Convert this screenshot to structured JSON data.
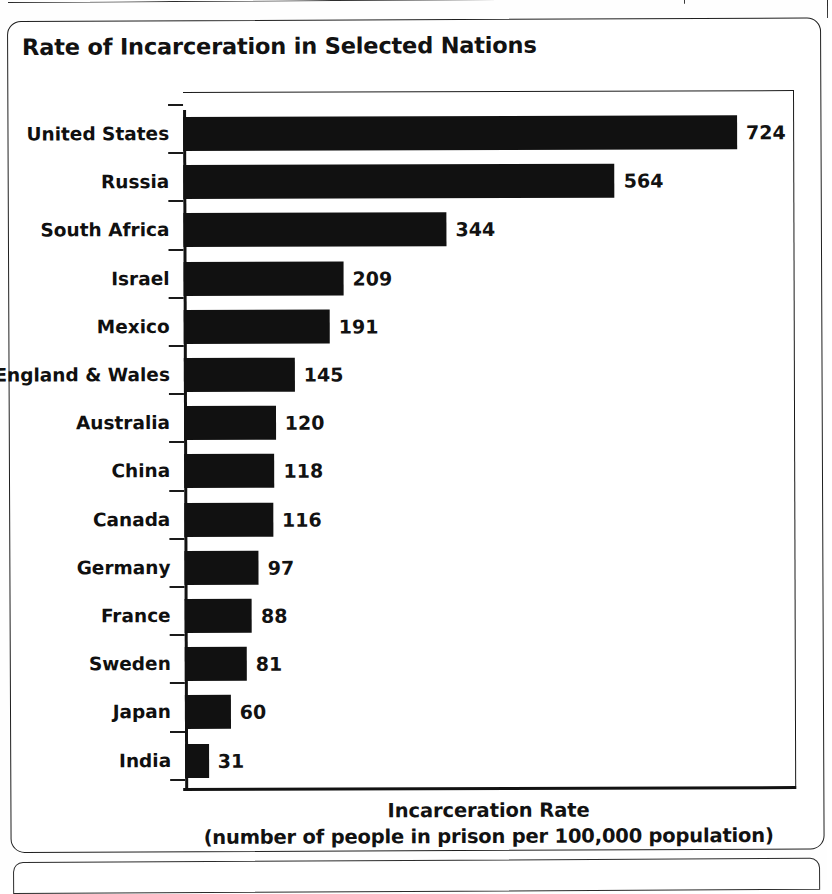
{
  "chart_title": "Rate of Incarceration in Selected Nations",
  "axis": {
    "x_caption_line1": "Incarceration Rate",
    "x_caption_line2": "(number of people in prison per 100,000 population)"
  },
  "colors": {
    "bar": "#111111",
    "text": "#121212",
    "axis": "#1a1a1a",
    "background": "#ffffff"
  },
  "chart_data": {
    "type": "bar",
    "orientation": "horizontal",
    "title": "Rate of Incarceration in Selected Nations",
    "xlabel": "Incarceration Rate (number of people in prison per 100,000 population)",
    "ylabel": "",
    "xlim": [
      0,
      760
    ],
    "grid": false,
    "legend": null,
    "data_labels": true,
    "categories": [
      "United States",
      "Russia",
      "South Africa",
      "Israel",
      "Mexico",
      "England & Wales",
      "Australia",
      "China",
      "Canada",
      "Germany",
      "France",
      "Sweden",
      "Japan",
      "India"
    ],
    "values": [
      724,
      564,
      344,
      209,
      191,
      145,
      120,
      118,
      116,
      97,
      88,
      81,
      60,
      31
    ],
    "value_labels": [
      "724",
      "564",
      "344",
      "209",
      "191",
      "145",
      "120",
      "118",
      "116",
      "97",
      "88",
      "81",
      "60",
      "31"
    ]
  }
}
